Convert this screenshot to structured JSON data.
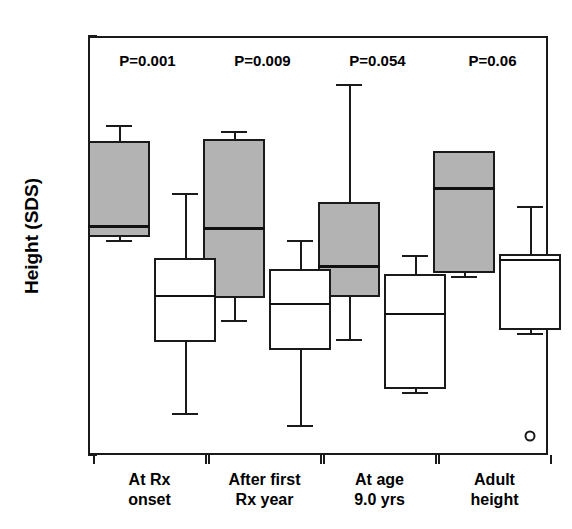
{
  "chart_data": {
    "type": "box",
    "title": "",
    "xlabel": "",
    "ylabel": "Height (SDS)",
    "ylim": [
      -4,
      2
    ],
    "yticks": [
      2,
      1,
      0,
      -1,
      -2,
      -3,
      -4
    ],
    "ytick_labels": [
      "2",
      "1",
      "0",
      "-1",
      "-2",
      "-3",
      "-4"
    ],
    "grid": false,
    "legend": "none",
    "categories": [
      "At Rx onset",
      "After first Rx year",
      "At age 9.0 yrs",
      "Adult height"
    ],
    "category_lines": [
      [
        "At Rx",
        "onset"
      ],
      [
        "After first",
        "Rx year"
      ],
      [
        "At age",
        "9.0 yrs"
      ],
      [
        "Adult",
        "height"
      ]
    ],
    "annotations": [
      {
        "text": "P=0.001",
        "category": "At Rx onset"
      },
      {
        "text": "P=0.009",
        "category": "After first Rx year"
      },
      {
        "text": "P=0.054",
        "category": "At age 9.0 yrs"
      },
      {
        "text": "P=0.06",
        "category": "Adult height"
      }
    ],
    "series": [
      {
        "name": "shaded-group",
        "fill": "#b3b3b3",
        "boxes": [
          {
            "category": "At Rx onset",
            "whisker_low": -0.92,
            "q1": -0.88,
            "median": -0.71,
            "q3": 0.49,
            "whisker_high": 0.73
          },
          {
            "category": "After first Rx year",
            "whisker_low": -2.07,
            "q1": -1.75,
            "median": -0.73,
            "q3": 0.52,
            "whisker_high": 0.64
          },
          {
            "category": "At age 9.0 yrs",
            "whisker_low": -2.34,
            "q1": -1.74,
            "median": -1.28,
            "q3": -0.38,
            "whisker_high": 1.31
          },
          {
            "category": "Adult height",
            "whisker_low": -1.44,
            "q1": -1.4,
            "median": -0.16,
            "q3": 0.36,
            "whisker_high": 0.36
          }
        ]
      },
      {
        "name": "open-group",
        "fill": "#ffffff",
        "boxes": [
          {
            "category": "At Rx onset",
            "whisker_low": -3.4,
            "q1": -2.38,
            "median": -1.71,
            "q3": -1.18,
            "whisker_high": -0.25
          },
          {
            "category": "After first Rx year",
            "whisker_low": -3.57,
            "q1": -2.5,
            "median": -1.82,
            "q3": -1.34,
            "whisker_high": -0.92
          },
          {
            "category": "At age 9.0 yrs",
            "whisker_low": -3.1,
            "q1": -3.05,
            "median": -1.97,
            "q3": -1.41,
            "whisker_high": -1.13
          },
          {
            "category": "Adult height",
            "whisker_low": -2.25,
            "q1": -2.21,
            "median": -1.2,
            "q3": -1.12,
            "whisker_high": -0.44,
            "outliers": [
              -3.73
            ]
          }
        ]
      }
    ]
  }
}
